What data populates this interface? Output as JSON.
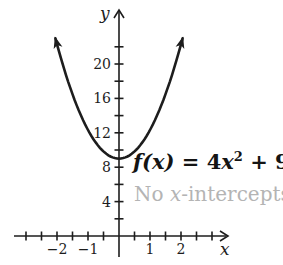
{
  "colors": {
    "ink": "#1d1d1d",
    "muted": "#b4b4b4",
    "background": "#ffffff"
  },
  "equation": {
    "lhs_italic": "f(x)",
    "mid": " = 4",
    "x_italic": "x",
    "exponent": "2",
    "tail": " + 9"
  },
  "annotation": {
    "pre": "No ",
    "x_italic": "x",
    "post": "-intercepts"
  },
  "chart_data": {
    "type": "line",
    "title": "",
    "function_label": "f(x) = 4x² + 9",
    "annotation": "No x-intercepts",
    "coefficients": {
      "a": 4,
      "b": 0,
      "c": 9
    },
    "vertex": [
      0,
      9
    ],
    "y_intercept": 9,
    "x_intercepts": [],
    "xlabel": "x",
    "ylabel": "y",
    "xlim": [
      -3.4,
      3.5
    ],
    "ylim": [
      -2.5,
      26.5
    ],
    "grid": false,
    "legend": false,
    "x_ticks": [
      -3,
      -2.5,
      -2,
      -1.5,
      -1,
      -0.5,
      0.5,
      1,
      1.5,
      2,
      2.5,
      3
    ],
    "x_tick_labels": [
      {
        "value": -2,
        "label": "−2"
      },
      {
        "value": -1,
        "label": "−1"
      },
      {
        "value": 1,
        "label": "1"
      },
      {
        "value": 2,
        "label": "2"
      }
    ],
    "y_ticks": [
      2,
      4,
      6,
      8,
      10,
      12,
      14,
      16,
      18,
      20,
      22
    ],
    "y_tick_labels": [
      {
        "value": 4,
        "label": "4"
      },
      {
        "value": 8,
        "label": "8"
      },
      {
        "value": 12,
        "label": "12"
      },
      {
        "value": 16,
        "label": "16"
      },
      {
        "value": 20,
        "label": "20"
      }
    ],
    "curve_x_range": [
      -1.87,
      1.87
    ]
  }
}
